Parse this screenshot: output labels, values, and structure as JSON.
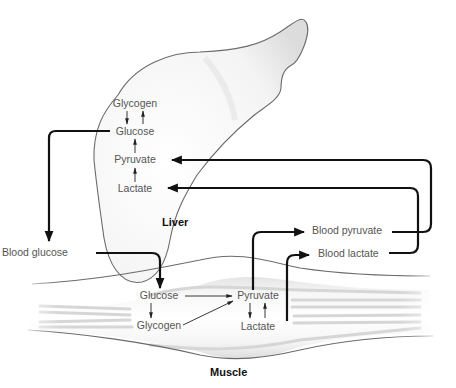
{
  "organs": {
    "liver": {
      "label": "Liver",
      "metabolites": {
        "glycogen": "Glycogen",
        "glucose": "Glucose",
        "pyruvate": "Pyruvate",
        "lactate": "Lactate"
      }
    },
    "muscle": {
      "label": "Muscle",
      "metabolites": {
        "glucose": "Glucose",
        "glycogen": "Glycogen",
        "pyruvate": "Pyruvate",
        "lactate": "Lactate"
      }
    }
  },
  "blood": {
    "glucose": "Blood glucose",
    "pyruvate": "Blood pyruvate",
    "lactate": "Blood lactate"
  },
  "colors": {
    "flow_arrow": "#111111",
    "metabolite_text": "#555555",
    "organ_outline": "#6b6b6b",
    "organ_fill": "#f2f2f2"
  }
}
